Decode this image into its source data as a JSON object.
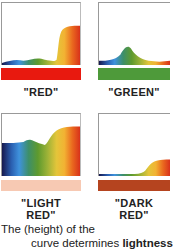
{
  "panels": [
    {
      "id": "red",
      "label": "\"RED\"",
      "swatch_color": "#e8190f",
      "curve": "M0,58 C8,56 14,54 22,56 C30,55 36,52 44,55 C50,56 54,57 56,55 C58,45 58,30 62,26 C66,22 72,22 80,22 L80,60 L0,60 Z"
    },
    {
      "id": "green",
      "label": "\"GREEN\"",
      "swatch_color": "#4e9a3a",
      "curve": "M0,60 L0,56 C10,56 18,55 24,50 C28,44 32,40 36,44 C40,50 46,54 56,56 C64,57 72,57 80,56 L80,60 Z"
    },
    {
      "id": "light_red",
      "label_lines": [
        "\"LIGHT",
        "RED\""
      ],
      "swatch_color": "#f7c9b3",
      "curve": "M0,60 L0,28 C8,28 16,28 22,27 C26,25 28,24 32,26 C36,28 40,29 44,30 C48,27 50,20 56,16 C62,12 70,12 80,12 L80,60 Z"
    },
    {
      "id": "dark_red",
      "label_lines": [
        "\"DARK",
        "RED\""
      ],
      "swatch_color": "#b5441f",
      "curve": "M0,60 L0,58 C14,58 26,58 40,58 C46,58 50,57 52,55 C56,50 60,46 66,45 C70,44 74,44 80,44 L80,60 Z"
    }
  ],
  "caption": {
    "line1": "The (height) of the",
    "line2_pre": "curve determines ",
    "line2_bold": "lightness"
  },
  "spectrum_stops": [
    "#16184e",
    "#2a5fb0",
    "#3f92dd",
    "#3d8f6a",
    "#5e9a2e",
    "#9cb237",
    "#e4c53a",
    "#f2b233",
    "#ea6a1f",
    "#d8311a"
  ]
}
